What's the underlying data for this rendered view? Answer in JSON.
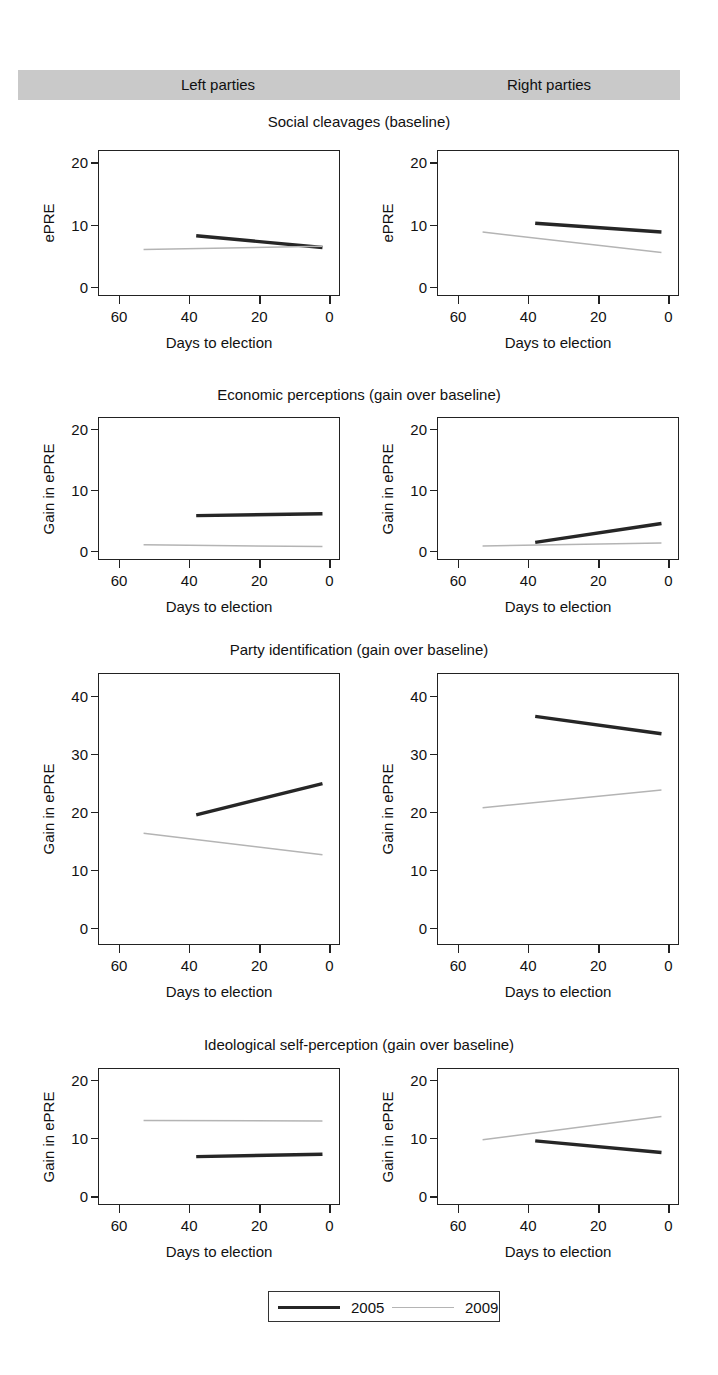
{
  "figure": {
    "groups": [
      {
        "name": "group-left",
        "label": "Left parties"
      },
      {
        "name": "group-right",
        "label": "Right parties"
      }
    ],
    "row_titles": [
      "Social cleavages (baseline)",
      "Economic perceptions (gain over baseline)",
      "Party identification (gain over baseline)",
      "Ideological self-perception (gain over baseline)"
    ],
    "legend": {
      "entries": [
        {
          "label": "2005",
          "color": "#262626",
          "style": "thick-solid"
        },
        {
          "label": "2009",
          "color": "#b4b4b4",
          "style": "thin-solid"
        }
      ]
    },
    "colors": {
      "series_2005": "#262626",
      "series_2009": "#b4b4b4",
      "band": "#c9c9c9",
      "frame": "#222222"
    }
  },
  "chart_data": [
    {
      "type": "line",
      "title": "Social cleavages (baseline)",
      "panel": "Left parties",
      "xlabel": "Days to election",
      "ylabel": "ePRE",
      "xlim": [
        66,
        -3
      ],
      "ylim": [
        -1.5,
        22
      ],
      "xticks": [
        60,
        40,
        20,
        0
      ],
      "yticks": [
        0,
        10,
        20
      ],
      "grid": false,
      "x_reversed": true,
      "series": [
        {
          "name": "2005",
          "x": [
            38,
            2
          ],
          "y": [
            8.2,
            6.3
          ]
        },
        {
          "name": "2009",
          "x": [
            53,
            2
          ],
          "y": [
            6.0,
            6.5
          ]
        }
      ]
    },
    {
      "type": "line",
      "title": "Social cleavages (baseline)",
      "panel": "Right parties",
      "xlabel": "Days to election",
      "ylabel": "ePRE",
      "xlim": [
        66,
        -3
      ],
      "ylim": [
        -1.5,
        22
      ],
      "xticks": [
        60,
        40,
        20,
        0
      ],
      "yticks": [
        0,
        10,
        20
      ],
      "grid": false,
      "x_reversed": true,
      "series": [
        {
          "name": "2005",
          "x": [
            38,
            2
          ],
          "y": [
            10.2,
            8.8
          ]
        },
        {
          "name": "2009",
          "x": [
            53,
            2
          ],
          "y": [
            8.8,
            5.5
          ]
        }
      ]
    },
    {
      "type": "line",
      "title": "Economic perceptions (gain over baseline)",
      "panel": "Left parties",
      "xlabel": "Days to election",
      "ylabel": "Gain in ePRE",
      "xlim": [
        66,
        -3
      ],
      "ylim": [
        -1.5,
        22
      ],
      "xticks": [
        60,
        40,
        20,
        0
      ],
      "yticks": [
        0,
        10,
        20
      ],
      "grid": false,
      "x_reversed": true,
      "series": [
        {
          "name": "2005",
          "x": [
            38,
            2
          ],
          "y": [
            5.8,
            6.1
          ]
        },
        {
          "name": "2009",
          "x": [
            53,
            2
          ],
          "y": [
            1.0,
            0.7
          ]
        }
      ]
    },
    {
      "type": "line",
      "title": "Economic perceptions (gain over baseline)",
      "panel": "Right parties",
      "xlabel": "Days to election",
      "ylabel": "Gain in ePRE",
      "xlim": [
        66,
        -3
      ],
      "ylim": [
        -1.5,
        22
      ],
      "xticks": [
        60,
        40,
        20,
        0
      ],
      "yticks": [
        0,
        10,
        20
      ],
      "grid": false,
      "x_reversed": true,
      "series": [
        {
          "name": "2005",
          "x": [
            38,
            2
          ],
          "y": [
            1.4,
            4.5
          ]
        },
        {
          "name": "2009",
          "x": [
            53,
            2
          ],
          "y": [
            0.8,
            1.3
          ]
        }
      ]
    },
    {
      "type": "line",
      "title": "Party identification (gain over baseline)",
      "panel": "Left parties",
      "xlabel": "Days to election",
      "ylabel": "Gain in ePRE",
      "xlim": [
        66,
        -3
      ],
      "ylim": [
        -3,
        44
      ],
      "xticks": [
        60,
        40,
        20,
        0
      ],
      "yticks": [
        0,
        10,
        20,
        30,
        40
      ],
      "grid": false,
      "x_reversed": true,
      "series": [
        {
          "name": "2005",
          "x": [
            38,
            2
          ],
          "y": [
            19.5,
            24.9
          ]
        },
        {
          "name": "2009",
          "x": [
            53,
            2
          ],
          "y": [
            16.3,
            12.6
          ]
        }
      ]
    },
    {
      "type": "line",
      "title": "Party identification (gain over baseline)",
      "panel": "Right parties",
      "xlabel": "Days to election",
      "ylabel": "Gain in ePRE",
      "xlim": [
        66,
        -3
      ],
      "ylim": [
        -3,
        44
      ],
      "xticks": [
        60,
        40,
        20,
        0
      ],
      "yticks": [
        0,
        10,
        20,
        30,
        40
      ],
      "grid": false,
      "x_reversed": true,
      "series": [
        {
          "name": "2005",
          "x": [
            38,
            2
          ],
          "y": [
            36.5,
            33.5
          ]
        },
        {
          "name": "2009",
          "x": [
            53,
            2
          ],
          "y": [
            20.7,
            23.8
          ]
        }
      ]
    },
    {
      "type": "line",
      "title": "Ideological self-perception (gain over baseline)",
      "panel": "Left parties",
      "xlabel": "Days to election",
      "ylabel": "Gain in ePRE",
      "xlim": [
        66,
        -3
      ],
      "ylim": [
        -1.5,
        22
      ],
      "xticks": [
        60,
        40,
        20,
        0
      ],
      "yticks": [
        0,
        10,
        20
      ],
      "grid": false,
      "x_reversed": true,
      "series": [
        {
          "name": "2005",
          "x": [
            38,
            2
          ],
          "y": [
            6.8,
            7.2
          ]
        },
        {
          "name": "2009",
          "x": [
            53,
            2
          ],
          "y": [
            13.0,
            12.9
          ]
        }
      ]
    },
    {
      "type": "line",
      "title": "Ideological self-perception (gain over baseline)",
      "panel": "Right parties",
      "xlabel": "Days to election",
      "ylabel": "Gain in ePRE",
      "xlim": [
        66,
        -3
      ],
      "ylim": [
        -1.5,
        22
      ],
      "xticks": [
        60,
        40,
        20,
        0
      ],
      "yticks": [
        0,
        10,
        20
      ],
      "grid": false,
      "x_reversed": true,
      "series": [
        {
          "name": "2005",
          "x": [
            38,
            2
          ],
          "y": [
            9.5,
            7.5
          ]
        },
        {
          "name": "2009",
          "x": [
            53,
            2
          ],
          "y": [
            9.7,
            13.7
          ]
        }
      ]
    }
  ],
  "layout": {
    "panels": [
      {
        "left": 98,
        "top": 150,
        "width": 242,
        "height": 146
      },
      {
        "left": 437,
        "top": 150,
        "width": 242,
        "height": 146
      },
      {
        "left": 98,
        "top": 417,
        "width": 242,
        "height": 143
      },
      {
        "left": 437,
        "top": 417,
        "width": 242,
        "height": 143
      },
      {
        "left": 98,
        "top": 673,
        "width": 242,
        "height": 272
      },
      {
        "left": 437,
        "top": 673,
        "width": 242,
        "height": 272
      },
      {
        "left": 98,
        "top": 1068,
        "width": 242,
        "height": 137
      },
      {
        "left": 437,
        "top": 1068,
        "width": 242,
        "height": 137
      }
    ],
    "row_title_tops": [
      113,
      386,
      641,
      1036
    ]
  }
}
